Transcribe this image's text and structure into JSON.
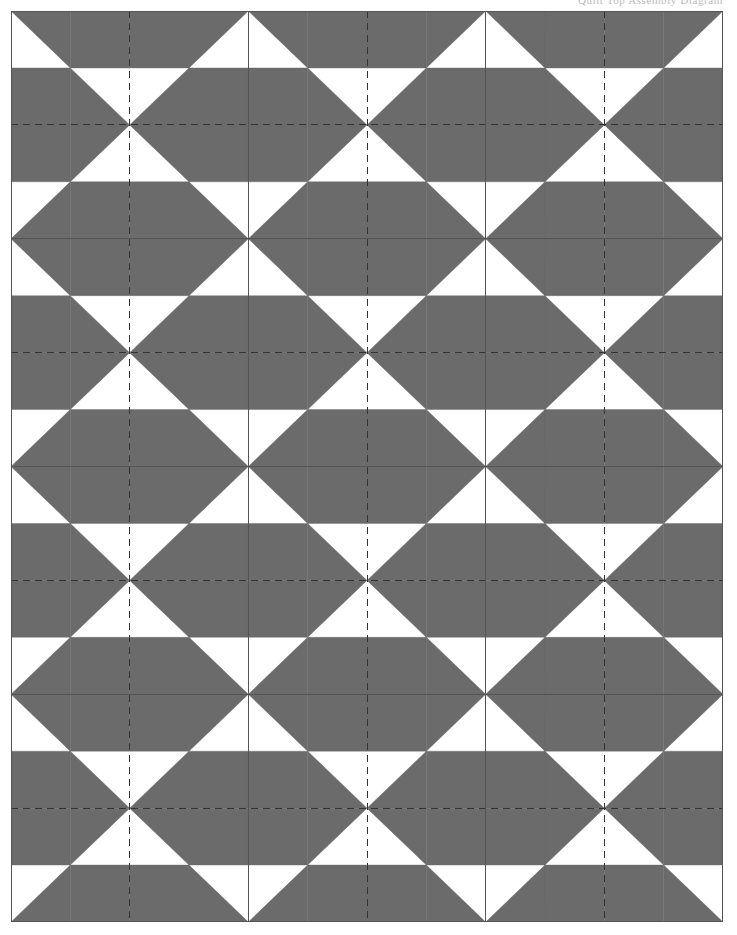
{
  "document": {
    "title": "Quilt Block Pattern Diagram",
    "header_partial_text": "Quilt Top Assembly Diagram",
    "page_background": "#ffffff"
  },
  "pattern": {
    "name": "four-patch-x-block-layout",
    "description": "Grid of pieced quilt blocks; each block is a 4 by 4 arrangement of half-square-triangle units forming a large X / pinwheel motif. Blocks tile edge to edge so adjacent motifs merge into continuous diagonal chains.",
    "block_motif": "x-block",
    "fill_color": "#6b6b6b",
    "background_color": "#ffffff",
    "outline_color": "#333333",
    "solid_line_color": "#555555",
    "dashed_line_color": "#333333",
    "columns": 3,
    "rows": 4,
    "block_width": 237.33,
    "block_height": 227.75,
    "units_per_block_side": 4,
    "solid_line_width": 1,
    "dashed_line_width": 1,
    "dash_pattern": "7,5",
    "border": {
      "left": 11,
      "top": 11,
      "right": 723,
      "bottom": 922,
      "width": 712,
      "height": 911,
      "stroke": "#555555",
      "stroke_width": 1
    },
    "vertical_solid_lines_x": [
      0,
      237.33,
      474.67,
      712
    ],
    "horizontal_solid_lines_y": [
      0,
      227.75,
      455.5,
      683.25,
      911
    ],
    "vertical_dashed_lines_x": [
      118.67,
      356.0,
      593.33
    ],
    "horizontal_dashed_lines_y": [
      113.88,
      341.63,
      569.38,
      797.13
    ],
    "block_grid_labels": [
      [
        "block-r1c1",
        "block-r1c2",
        "block-r1c3"
      ],
      [
        "block-r2c1",
        "block-r2c2",
        "block-r2c3"
      ],
      [
        "block-r3c1",
        "block-r3c2",
        "block-r3c3"
      ],
      [
        "block-r4c1",
        "block-r4c2",
        "block-r4c3"
      ]
    ]
  },
  "chart_data": {
    "type": "heatmap",
    "xlabel": "",
    "ylabel": "",
    "legend": [],
    "grid": true,
    "categories": [
      "col-1",
      "col-2",
      "col-3"
    ],
    "rows": [
      "row-1",
      "row-2",
      "row-3",
      "row-4"
    ],
    "cell_unit_grid": 4,
    "note": "Each of the 12 blocks repeats the identical X motif made of half-square-triangle units.",
    "unit_fill_map": [
      [
        "white-lower-left",
        "grey-full",
        "grey-full",
        "white-lower-right"
      ],
      [
        "grey-full",
        "white-upper-right",
        "white-upper-left",
        "grey-full"
      ],
      [
        "grey-full",
        "white-lower-right",
        "white-lower-left",
        "grey-full"
      ],
      [
        "white-upper-left",
        "grey-full",
        "grey-full",
        "white-upper-right"
      ]
    ]
  }
}
